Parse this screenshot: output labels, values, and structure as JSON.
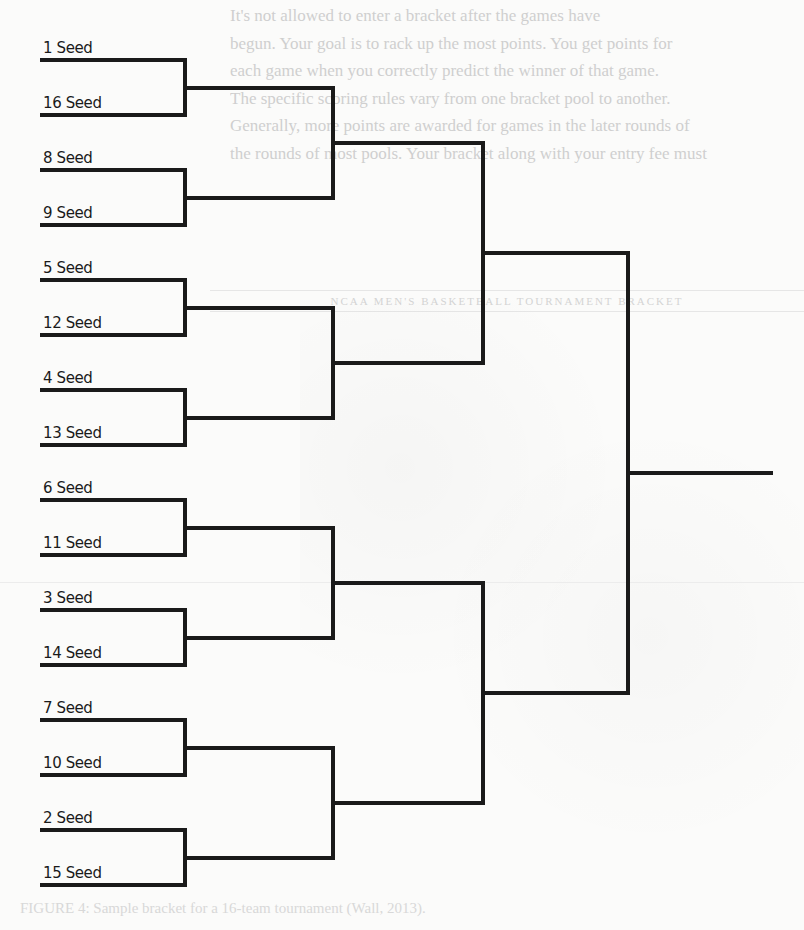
{
  "background": {
    "bleed_text_lines": [
      "It's not allowed to enter a bracket after the games have",
      "begun. Your goal is to rack up the most points. You get points for",
      "each game when you correctly predict the winner of that game.",
      "The specific scoring rules vary from one bracket pool to another.",
      "Generally, more points are awarded for games in the later rounds of",
      "the rounds of most pools. Your bracket along with your entry fee must"
    ],
    "heading_text": "NCAA MEN'S BASKETBALL TOURNAMENT BRACKET",
    "footer_text": "FIGURE 4: Sample bracket for a 16-team tournament (Wall, 2013)."
  },
  "bracket": {
    "line_color": "#1a1a1a",
    "seeds": [
      {
        "label": "1 Seed"
      },
      {
        "label": "16 Seed"
      },
      {
        "label": "8 Seed"
      },
      {
        "label": "9 Seed"
      },
      {
        "label": "5 Seed"
      },
      {
        "label": "12 Seed"
      },
      {
        "label": "4 Seed"
      },
      {
        "label": "13 Seed"
      },
      {
        "label": "6 Seed"
      },
      {
        "label": "11 Seed"
      },
      {
        "label": "3 Seed"
      },
      {
        "label": "14 Seed"
      },
      {
        "label": "7 Seed"
      },
      {
        "label": "10 Seed"
      },
      {
        "label": "2 Seed"
      },
      {
        "label": "15 Seed"
      }
    ],
    "rounds": [
      "Round of 16",
      "Quarterfinals",
      "Semifinals",
      "Final",
      "Champion"
    ]
  }
}
